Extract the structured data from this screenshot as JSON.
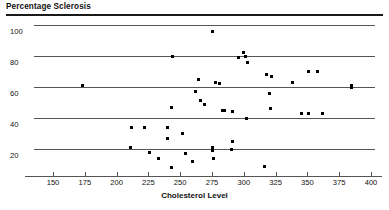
{
  "chart_data": {
    "type": "scatter",
    "title": "Percentage Sclerosis",
    "xlabel": "Cholesterol Level",
    "ylabel": "Percentage Sclerosis",
    "xlim": [
      137,
      400
    ],
    "ylim": [
      0,
      100
    ],
    "xticks": [
      150,
      175,
      200,
      225,
      250,
      275,
      300,
      325,
      350,
      375,
      400
    ],
    "yticks": [
      20,
      40,
      60,
      80,
      100
    ],
    "grid": "horizontal",
    "legend": "none",
    "marker": "square",
    "marker_color": "#000000",
    "points": [
      {
        "x": 173,
        "y": 61
      },
      {
        "x": 244,
        "y": 80
      },
      {
        "x": 275,
        "y": 96
      },
      {
        "x": 264,
        "y": 65
      },
      {
        "x": 262,
        "y": 57
      },
      {
        "x": 243,
        "y": 47
      },
      {
        "x": 266,
        "y": 51
      },
      {
        "x": 269,
        "y": 49
      },
      {
        "x": 278,
        "y": 63
      },
      {
        "x": 281,
        "y": 62
      },
      {
        "x": 283,
        "y": 45
      },
      {
        "x": 285,
        "y": 45
      },
      {
        "x": 291,
        "y": 44
      },
      {
        "x": 296,
        "y": 79
      },
      {
        "x": 300,
        "y": 82
      },
      {
        "x": 301,
        "y": 80
      },
      {
        "x": 303,
        "y": 76
      },
      {
        "x": 302,
        "y": 40
      },
      {
        "x": 318,
        "y": 68
      },
      {
        "x": 322,
        "y": 67
      },
      {
        "x": 320,
        "y": 56
      },
      {
        "x": 321,
        "y": 46
      },
      {
        "x": 338,
        "y": 63
      },
      {
        "x": 351,
        "y": 70
      },
      {
        "x": 358,
        "y": 70
      },
      {
        "x": 345,
        "y": 43
      },
      {
        "x": 351,
        "y": 43
      },
      {
        "x": 362,
        "y": 43
      },
      {
        "x": 385,
        "y": 61
      },
      {
        "x": 385,
        "y": 60
      },
      {
        "x": 212,
        "y": 34
      },
      {
        "x": 222,
        "y": 34
      },
      {
        "x": 240,
        "y": 34
      },
      {
        "x": 240,
        "y": 27
      },
      {
        "x": 252,
        "y": 30
      },
      {
        "x": 211,
        "y": 21
      },
      {
        "x": 226,
        "y": 18
      },
      {
        "x": 233,
        "y": 14
      },
      {
        "x": 243,
        "y": 8
      },
      {
        "x": 254,
        "y": 17
      },
      {
        "x": 260,
        "y": 12
      },
      {
        "x": 275,
        "y": 21
      },
      {
        "x": 275,
        "y": 19
      },
      {
        "x": 276,
        "y": 14
      },
      {
        "x": 291,
        "y": 25
      },
      {
        "x": 290,
        "y": 20
      },
      {
        "x": 316,
        "y": 9
      }
    ]
  },
  "axis": {
    "y_tick_labels": [
      "100",
      "80",
      "60",
      "40",
      "20"
    ],
    "x_tick_labels": [
      "150",
      "175",
      "200",
      "225",
      "250",
      "275",
      "300",
      "325",
      "350",
      "375",
      "400"
    ]
  }
}
